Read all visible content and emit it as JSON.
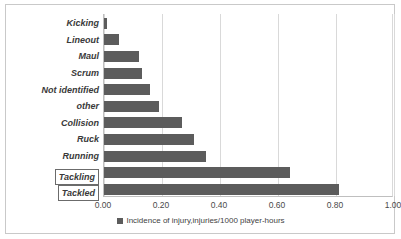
{
  "chart_data": {
    "type": "bar",
    "orientation": "horizontal",
    "title": "",
    "xlabel": "",
    "ylabel": "",
    "xlim": [
      0.0,
      1.0
    ],
    "grid": true,
    "legend_position": "bottom",
    "categories": [
      "Kicking",
      "Lineout",
      "Maul",
      "Scrum",
      "Not identified",
      "other",
      "Collision",
      "Ruck",
      "Running",
      "Tackling",
      "Tackled"
    ],
    "values": [
      0.01,
      0.05,
      0.12,
      0.13,
      0.16,
      0.19,
      0.27,
      0.31,
      0.35,
      0.64,
      0.81
    ],
    "highlighted_categories": [
      "Tackling",
      "Tackled"
    ],
    "series": [
      {
        "name": "Incidence of injury,injuries/1000 player-hours",
        "color": "#5C5C5C",
        "values": [
          0.01,
          0.05,
          0.12,
          0.13,
          0.16,
          0.19,
          0.27,
          0.31,
          0.35,
          0.64,
          0.81
        ]
      }
    ],
    "xticks": [
      0.0,
      0.2,
      0.4,
      0.6,
      0.8,
      1.0
    ],
    "xticklabels": [
      "0.00",
      "0.20",
      "0.40",
      "0.60",
      "0.80",
      "1.00"
    ]
  },
  "legend": {
    "label": "Incidence of injury,injuries/1000 player-hours",
    "swatch_color": "#5C5C5C"
  },
  "axis": {
    "ticks": [
      {
        "label": "0.00",
        "value": 0.0
      },
      {
        "label": "0.20",
        "value": 0.2
      },
      {
        "label": "0.40",
        "value": 0.4
      },
      {
        "label": "0.60",
        "value": 0.6
      },
      {
        "label": "0.80",
        "value": 0.8
      },
      {
        "label": "1.00",
        "value": 1.0
      }
    ]
  },
  "categories": [
    {
      "label": "Kicking",
      "value": 0.01,
      "boxed": false
    },
    {
      "label": "Lineout",
      "value": 0.05,
      "boxed": false
    },
    {
      "label": "Maul",
      "value": 0.12,
      "boxed": false
    },
    {
      "label": "Scrum",
      "value": 0.13,
      "boxed": false
    },
    {
      "label": "Not identified",
      "value": 0.16,
      "boxed": false
    },
    {
      "label": "other",
      "value": 0.19,
      "boxed": false
    },
    {
      "label": "Collision",
      "value": 0.27,
      "boxed": false
    },
    {
      "label": "Ruck",
      "value": 0.31,
      "boxed": false
    },
    {
      "label": "Running",
      "value": 0.35,
      "boxed": false
    },
    {
      "label": "Tackling",
      "value": 0.64,
      "boxed": true
    },
    {
      "label": "Tackled",
      "value": 0.81,
      "boxed": true
    }
  ],
  "colors": {
    "bar": "#5C5C5C",
    "grid": "#D9D9D9",
    "frame": "#C9C9C9",
    "text": "#3A3A3A"
  }
}
